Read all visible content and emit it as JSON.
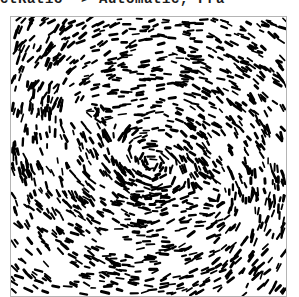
{
  "code_line": {
    "text": "AspectRatio -> Automatic, Fra",
    "clipped": true
  },
  "panel": {
    "border_color": "#b4b4b4",
    "background_color": "#ffffff"
  },
  "chart_data": {
    "type": "scatter",
    "title": "",
    "subtitle": "",
    "xlabel": "",
    "ylabel": "",
    "xlim": [
      -1,
      1
    ],
    "ylim": [
      -1,
      1
    ],
    "grid": false,
    "legend": null,
    "tick_labels_x": [],
    "tick_labels_y": [],
    "frame": true,
    "axes_visible": false,
    "marker": {
      "shape": "dash",
      "color": "#000000",
      "length_px": 6,
      "thickness_px": 2.2
    },
    "field": {
      "model": "vortex",
      "center": [
        0.02,
        -0.04
      ],
      "swirl_strength": 1.0,
      "radial_strength": 0.22,
      "secondary_centers": [
        [
          -0.45,
          0.35
        ],
        [
          0.5,
          -0.3
        ]
      ],
      "n_points": 2300,
      "seed": 20250214,
      "density_falloff": 0.55,
      "jitter": 0.34
    }
  }
}
